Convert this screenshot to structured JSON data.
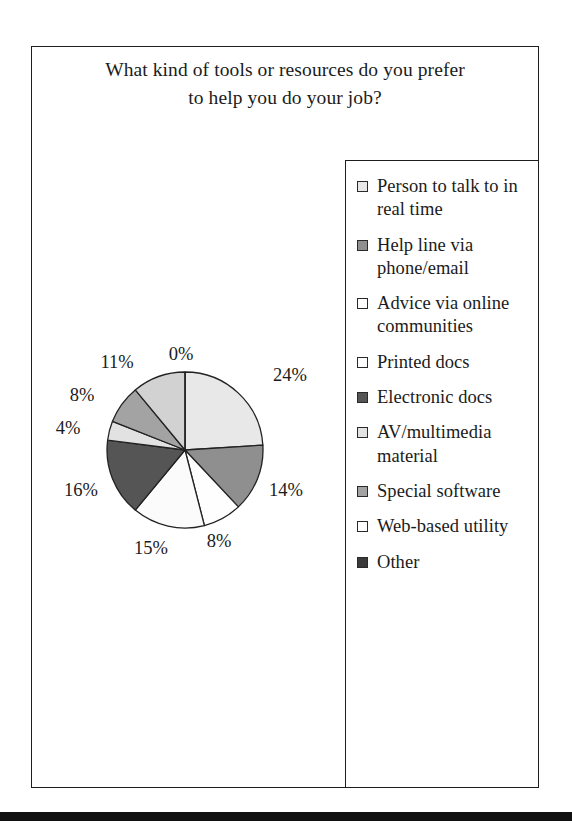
{
  "chart_data": {
    "type": "pie",
    "title": "What kind of tools or resources do you prefer to help you do your job?",
    "title_lines": [
      "What kind of tools or resources do you prefer",
      "to help you do your job?"
    ],
    "legend_position": "right",
    "grid": false,
    "units": "percent",
    "categories": [
      "Person to talk to in real time",
      "Help line via phone/email",
      "Advice via online communities",
      "Printed docs",
      "Electronic docs",
      "AV/multimedia material",
      "Special software",
      "Web-based utility",
      "Other"
    ],
    "values": [
      24,
      14,
      8,
      15,
      16,
      4,
      8,
      11,
      0
    ],
    "labels": [
      "24%",
      "14%",
      "8%",
      "15%",
      "16%",
      "4%",
      "8%",
      "11%",
      "0%"
    ],
    "slice_colors": [
      "#e8e8e8",
      "#8f8f8f",
      "#fefefe",
      "#fbfbfb",
      "#555555",
      "#e2e2e2",
      "#a3a3a3",
      "#d2d2d2",
      "#3a3a3a"
    ]
  },
  "title": {
    "line1": "What kind of tools or resources do you prefer",
    "line2": "to help you do your job?"
  },
  "pie": {
    "labels": [
      {
        "text": "24%",
        "x": 252,
        "y": 75
      },
      {
        "text": "14%",
        "x": 248,
        "y": 190
      },
      {
        "text": "8%",
        "x": 181,
        "y": 241
      },
      {
        "text": "15%",
        "x": 113,
        "y": 248
      },
      {
        "text": "16%",
        "x": 43,
        "y": 190
      },
      {
        "text": "4%",
        "x": 30,
        "y": 128
      },
      {
        "text": "8%",
        "x": 44,
        "y": 95
      },
      {
        "text": "11%",
        "x": 79,
        "y": 62
      },
      {
        "text": "0%",
        "x": 143,
        "y": 54
      }
    ]
  },
  "legend": {
    "items": [
      {
        "label": "Person to talk to in real time",
        "color": "#e8e8e8"
      },
      {
        "label": "Help line via phone/email",
        "color": "#8f8f8f"
      },
      {
        "label": "Advice via online communities",
        "color": "#ffffff"
      },
      {
        "label": "Printed docs",
        "color": "#ffffff"
      },
      {
        "label": "Electronic docs",
        "color": "#555555"
      },
      {
        "label": "AV/multimedia material",
        "color": "#e2e2e2"
      },
      {
        "label": "Special software",
        "color": "#a3a3a3"
      },
      {
        "label": "Web-based utility",
        "color": "#ffffff"
      },
      {
        "label": "Other",
        "color": "#3a3a3a"
      }
    ]
  }
}
